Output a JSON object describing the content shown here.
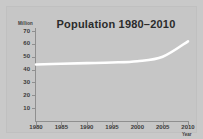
{
  "chart_data": {
    "type": "line",
    "title": "Population 1980–2010",
    "xlabel": "Year",
    "ylabel": "Million",
    "x": [
      1980,
      1985,
      1990,
      1995,
      2000,
      2005,
      2010
    ],
    "series": [
      {
        "name": "Population",
        "values": [
          44,
          44.5,
          45,
          45.5,
          46.5,
          50,
          62
        ],
        "color": "#ffffff"
      }
    ],
    "xlim": [
      1980,
      2010
    ],
    "ylim": [
      0,
      70
    ],
    "y_ticks": [
      70,
      60,
      50,
      40,
      30,
      20,
      10
    ],
    "x_ticks": [
      1980,
      1985,
      1990,
      1995,
      2000,
      2005,
      2010
    ],
    "grid": false,
    "legend": "none",
    "background_color": "#c6c6c6",
    "axis_color": "#8f8f8f",
    "text_color": "#3a3a3a"
  }
}
